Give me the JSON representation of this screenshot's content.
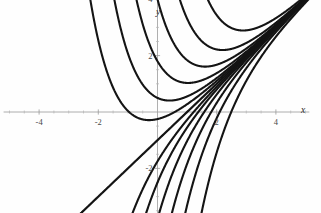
{
  "figure": {
    "width": 321,
    "height": 213,
    "background_color": "#fefefe",
    "curve_color": "#141414",
    "axis_color": "#9a9a9a",
    "label_color": "#4a4a4a"
  },
  "axes": {
    "x_label": "x",
    "y_label": "y",
    "x_ticks": [
      {
        "value": -4,
        "label": "-4"
      },
      {
        "value": -2,
        "label": "-2"
      },
      {
        "value": 2,
        "label": "2"
      },
      {
        "value": 4,
        "label": "4"
      }
    ],
    "y_ticks": [
      {
        "value": 4,
        "label": "4"
      },
      {
        "value": 2,
        "label": "2"
      },
      {
        "value": -2,
        "label": "-2"
      },
      {
        "value": -4,
        "label": "-4"
      }
    ]
  },
  "chart_data": {
    "type": "line",
    "title": "",
    "subtitle": "",
    "xlabel": "x",
    "ylabel": "y",
    "xlim": [
      -5.2,
      5.4
    ],
    "ylim": [
      -5.6,
      5.4
    ],
    "grid": false,
    "legend": "none",
    "x_tick_values": [
      -4,
      -2,
      2,
      4
    ],
    "y_tick_values": [
      -4,
      -2,
      2,
      4
    ],
    "x_tick_labels": [
      "-4",
      "-2",
      "2",
      "4"
    ],
    "y_tick_labels": [
      "-4",
      "-2",
      "2",
      "4"
    ],
    "asymptote": {
      "name": "y = x - 1",
      "slope": 1,
      "intercept": -1,
      "x_from": -5.2,
      "x_to": 5.3
    },
    "series": [
      {
        "name": "C = 18",
        "C": 18,
        "x_from": -1.95,
        "x_to": 5.3
      },
      {
        "name": "C = 9",
        "C": 9,
        "x_from": -2.55,
        "x_to": 5.3
      },
      {
        "name": "C = 5",
        "C": 5,
        "x_from": -3.05,
        "x_to": 5.3
      },
      {
        "name": "C = 2.8",
        "C": 2.8,
        "x_from": -3.55,
        "x_to": 5.3
      },
      {
        "name": "C = 1.5",
        "C": 1.5,
        "x_from": -4.05,
        "x_to": 5.3
      },
      {
        "name": "C = 0.75",
        "C": 0.75,
        "x_from": -4.65,
        "x_to": 5.3
      },
      {
        "name": "C = -0.75",
        "C": -0.75,
        "x_from": -2.05,
        "x_to": 5.3
      },
      {
        "name": "C = -1.5",
        "C": -1.5,
        "x_from": -2.6,
        "x_to": 5.3
      },
      {
        "name": "C = -2.8",
        "C": -2.8,
        "x_from": -3.2,
        "x_to": 5.3
      },
      {
        "name": "C = -5",
        "C": -5,
        "x_from": -3.7,
        "x_to": 5.3
      },
      {
        "name": "C = -9",
        "C": -9,
        "x_from": -4.25,
        "x_to": 5.3
      },
      {
        "name": "C = -18",
        "C": -18,
        "x_from": -4.8,
        "x_to": 5.3
      }
    ]
  }
}
